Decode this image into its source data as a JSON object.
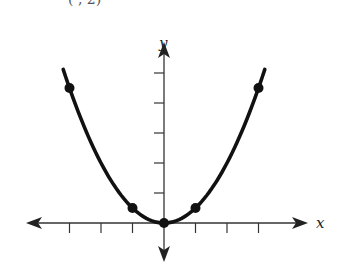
{
  "header": {
    "cutoff_text": "( , 2)"
  },
  "chart_data": {
    "type": "line",
    "title": "",
    "xlabel": "x",
    "ylabel": "y",
    "function": "y = x^2 / 2",
    "x": [
      -3.2,
      -3,
      -2,
      -1,
      0,
      1,
      2,
      3,
      3.2
    ],
    "series": [
      {
        "name": "parabola",
        "values": [
          5.12,
          4.5,
          2,
          0.5,
          0,
          0.5,
          2,
          4.5,
          5.12
        ]
      }
    ],
    "marked_points": [
      {
        "x": -3,
        "y": 4.5
      },
      {
        "x": -1,
        "y": 0.5
      },
      {
        "x": 0,
        "y": 0
      },
      {
        "x": 1,
        "y": 0.5
      },
      {
        "x": 3,
        "y": 4.5
      }
    ],
    "x_ticks": [
      -3,
      -2,
      -1,
      1,
      2,
      3
    ],
    "y_ticks": [
      1,
      2,
      3,
      4,
      5
    ],
    "xlim": [
      -4,
      5
    ],
    "ylim": [
      -1.3,
      6
    ],
    "grid": false,
    "legend": null,
    "colors": {
      "curve": "#111111",
      "axes": "#333333"
    }
  }
}
